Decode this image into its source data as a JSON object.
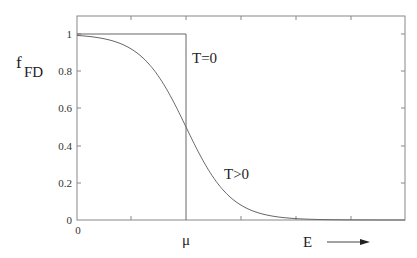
{
  "chart_data": {
    "type": "line",
    "title": "",
    "xlabel": "E",
    "ylabel": "f_FD",
    "ylabel_main": "f",
    "ylabel_sub": "FD",
    "x_tick_labels": [
      "0",
      "μ"
    ],
    "y_ticks": [
      0,
      0.2,
      0.4,
      0.6,
      0.8,
      1
    ],
    "y_tick_labels": [
      "0",
      "0.2",
      "0.4",
      "0.6",
      "0.8",
      "1"
    ],
    "ylim": [
      0,
      1.1
    ],
    "grid": false,
    "legend": "none",
    "series": [
      {
        "name": "T=0",
        "description": "step function: 1 for E<μ, 0 for E>μ",
        "points": [
          [
            0,
            1
          ],
          [
            2,
            1
          ],
          [
            2,
            0
          ]
        ]
      },
      {
        "name": "T>0",
        "description": "Fermi-Dirac distribution 1/(1+exp((E-μ)/kT)), equals 0.5 at E=μ",
        "x": [
          0,
          0.5,
          1.0,
          1.5,
          2.0,
          2.5,
          3.0,
          3.5,
          4.0,
          4.5,
          5.0
        ],
        "values": [
          0.99,
          0.98,
          0.92,
          0.77,
          0.5,
          0.23,
          0.08,
          0.02,
          0.01,
          0.0,
          0.0
        ]
      }
    ],
    "mu_position": 2,
    "annotations": [
      "T=0",
      "T>0",
      "μ",
      "E →"
    ]
  },
  "labels": {
    "y_main": "f",
    "y_sub": "FD",
    "x_zero": "0",
    "mu": "μ",
    "e_axis": "E",
    "t_zero": "T=0",
    "t_pos": "T>0",
    "ticks": {
      "y0": "0",
      "y02": "0.2",
      "y04": "0.4",
      "y06": "0.6",
      "y08": "0.8",
      "y1": "1"
    }
  }
}
